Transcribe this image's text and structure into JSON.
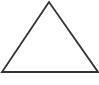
{
  "shape": {
    "type": "triangle",
    "stroke_color": "#333333",
    "fill_color": "#ffffff",
    "stroke_width": 1.8,
    "points": "49,2 2,72 98,72"
  }
}
